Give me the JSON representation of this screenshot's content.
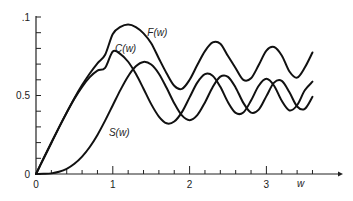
{
  "chart_data": {
    "type": "line",
    "title": "",
    "xlabel": "w",
    "ylabel": "",
    "xlim": [
      0,
      3.7
    ],
    "ylim": [
      0,
      1.0
    ],
    "grid": false,
    "legend": "inline labels",
    "x_ticks": [
      {
        "value": 0,
        "label": "0"
      },
      {
        "value": 1,
        "label": "1"
      },
      {
        "value": 2,
        "label": "2"
      },
      {
        "value": 3,
        "label": "3"
      }
    ],
    "y_ticks": [
      {
        "value": 0,
        "label": "0"
      },
      {
        "value": 0.5,
        "label": "0.5"
      },
      {
        "value": 1.0,
        "label": ".1"
      }
    ],
    "x": [
      0,
      0.1,
      0.2,
      0.3,
      0.4,
      0.5,
      0.6,
      0.7,
      0.8,
      0.9,
      1.0,
      1.1,
      1.2,
      1.3,
      1.4,
      1.5,
      1.6,
      1.7,
      1.8,
      1.9,
      2.0,
      2.1,
      2.2,
      2.3,
      2.4,
      2.5,
      2.6,
      2.7,
      2.8,
      2.9,
      3.0,
      3.1,
      3.2,
      3.3,
      3.4,
      3.5,
      3.6
    ],
    "series": [
      {
        "name": "C(w)",
        "label": "C(w)",
        "values": [
          0,
          0.1,
          0.199,
          0.297,
          0.391,
          0.479,
          0.555,
          0.617,
          0.659,
          0.676,
          0.78,
          0.764,
          0.715,
          0.638,
          0.543,
          0.445,
          0.366,
          0.323,
          0.334,
          0.394,
          0.488,
          0.582,
          0.636,
          0.626,
          0.555,
          0.457,
          0.389,
          0.392,
          0.468,
          0.562,
          0.606,
          0.562,
          0.466,
          0.405,
          0.438,
          0.533,
          0.588
        ]
      },
      {
        "name": "S(w)",
        "label": "S(w)",
        "values": [
          0,
          0.001,
          0.004,
          0.014,
          0.033,
          0.065,
          0.111,
          0.172,
          0.249,
          0.34,
          0.438,
          0.536,
          0.623,
          0.686,
          0.714,
          0.697,
          0.639,
          0.549,
          0.451,
          0.373,
          0.343,
          0.375,
          0.456,
          0.553,
          0.62,
          0.619,
          0.55,
          0.453,
          0.391,
          0.41,
          0.496,
          0.582,
          0.593,
          0.52,
          0.43,
          0.415,
          0.492
        ]
      },
      {
        "name": "F(w)",
        "label": "F(w)",
        "values": [
          0,
          0.1,
          0.199,
          0.297,
          0.392,
          0.483,
          0.566,
          0.64,
          0.705,
          0.76,
          0.892,
          0.937,
          0.952,
          0.936,
          0.896,
          0.833,
          0.736,
          0.642,
          0.562,
          0.542,
          0.6,
          0.694,
          0.783,
          0.838,
          0.83,
          0.751,
          0.674,
          0.6,
          0.61,
          0.694,
          0.786,
          0.809,
          0.755,
          0.653,
          0.614,
          0.678,
          0.774
        ]
      }
    ],
    "annotations": [
      {
        "text": "F(w)",
        "x": 1.45,
        "y": 0.88
      },
      {
        "text": "C(w)",
        "x": 1.03,
        "y": 0.78
      },
      {
        "text": "S(w)",
        "x": 0.95,
        "y": 0.24
      },
      {
        "text": "w",
        "x": 3.4,
        "y": -0.08
      }
    ]
  }
}
